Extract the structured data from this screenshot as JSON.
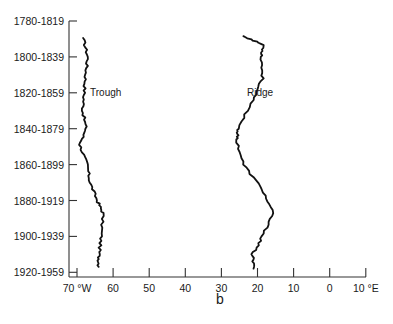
{
  "chart_data": {
    "type": "line",
    "title": "",
    "panel_label": "b",
    "orientation": "vertical (longitude on x, period on y)",
    "xlabel": "Longitude",
    "ylabel": "Period",
    "x_ticks": [
      {
        "label": "70 °W",
        "value": -70
      },
      {
        "label": "60",
        "value": -60
      },
      {
        "label": "50",
        "value": -50
      },
      {
        "label": "40",
        "value": -40
      },
      {
        "label": "30",
        "value": -30
      },
      {
        "label": "20",
        "value": -20
      },
      {
        "label": "10",
        "value": -10
      },
      {
        "label": "0",
        "value": 0
      },
      {
        "label": "10 °E",
        "value": 10
      }
    ],
    "xlim": [
      -70,
      10
    ],
    "y_ticks": [
      "1780-1819",
      "1800-1839",
      "1820-1859",
      "1840-1879",
      "1860-1899",
      "1880-1919",
      "1900-1939",
      "1920-1959"
    ],
    "grid": false,
    "legend": "none (inline labels)",
    "series": [
      {
        "name": "Trough",
        "label_position": "1820-1859",
        "points": [
          {
            "period_index": 0.47,
            "lon": -68.3
          },
          {
            "period_index": 1.0,
            "lon": -67.0
          },
          {
            "period_index": 1.5,
            "lon": -67.6
          },
          {
            "period_index": 2.0,
            "lon": -68.0
          },
          {
            "period_index": 2.5,
            "lon": -68.4
          },
          {
            "period_index": 3.0,
            "lon": -67.5
          },
          {
            "period_index": 3.45,
            "lon": -69.2
          },
          {
            "period_index": 4.0,
            "lon": -67.2
          },
          {
            "period_index": 4.5,
            "lon": -66.4
          },
          {
            "period_index": 5.0,
            "lon": -64.4
          },
          {
            "period_index": 5.35,
            "lon": -62.8
          },
          {
            "period_index": 6.0,
            "lon": -63.3
          },
          {
            "period_index": 6.5,
            "lon": -63.9
          },
          {
            "period_index": 6.85,
            "lon": -64.0
          }
        ]
      },
      {
        "name": "Ridge",
        "label_position": "1820-1859",
        "points": [
          {
            "period_index": 0.42,
            "lon": -23.9
          },
          {
            "period_index": 0.67,
            "lon": -18.3
          },
          {
            "period_index": 1.0,
            "lon": -18.9
          },
          {
            "period_index": 1.6,
            "lon": -18.6
          },
          {
            "period_index": 2.2,
            "lon": -21.4
          },
          {
            "period_index": 3.0,
            "lon": -25.3
          },
          {
            "period_index": 3.3,
            "lon": -25.8
          },
          {
            "period_index": 4.0,
            "lon": -23.9
          },
          {
            "period_index": 4.7,
            "lon": -18.6
          },
          {
            "period_index": 5.35,
            "lon": -15.8
          },
          {
            "period_index": 6.0,
            "lon": -18.6
          },
          {
            "period_index": 6.5,
            "lon": -21.4
          },
          {
            "period_index": 6.9,
            "lon": -21.1
          }
        ]
      }
    ]
  }
}
